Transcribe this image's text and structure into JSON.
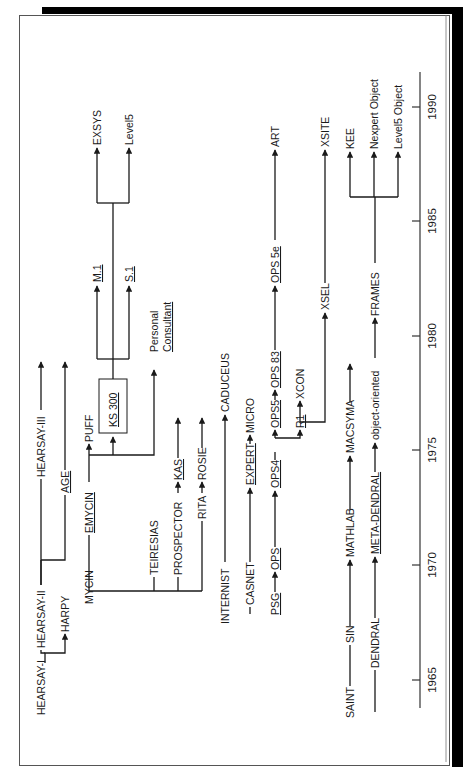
{
  "figure": {
    "orientation": "rotated -90deg (text reads bottom-to-top)"
  },
  "timeline": {
    "ticks": [
      {
        "label": "1965",
        "y": 680
      },
      {
        "label": "1970",
        "y": 565
      },
      {
        "label": "1975",
        "y": 450
      },
      {
        "label": "1980",
        "y": 336
      },
      {
        "label": "1985",
        "y": 221
      },
      {
        "label": "1990",
        "y": 107
      }
    ]
  },
  "nodes": {
    "hearsay1": "HEARSAY-I",
    "hearsay2": "HEARSAY-II",
    "hearsay3": "HEARSAY-III",
    "harpy": "HARPY",
    "age": "AGE",
    "mycin": "MYCIN",
    "emycin": "EMYCIN",
    "puff": "PUFF",
    "ks300": "KS 300",
    "m1": "M.1",
    "s1": "S.1",
    "exsys": "EXSYS",
    "level5": "Level5",
    "personal": "Personal",
    "consultant": "Consultant",
    "teiresias": "TEIRESIAS",
    "prospector": "PROSPECTOR",
    "kas": "KAS",
    "rita": "RITA",
    "rosie": "ROSIE",
    "internist": "INTERNIST",
    "caduceus": "CADUCEUS",
    "casnet": "CASNET",
    "expert": "EXPERT",
    "micro": "MICRO",
    "psg": "PSG",
    "ops": "OPS",
    "ops4": "OPS4",
    "ops5": "OPS5",
    "ops83": "OPS 83",
    "ops5e": "OPS 5e",
    "art": "ART",
    "r1": "R1",
    "xcon": "XCON",
    "xsel": "XSEL",
    "xsite": "XSITE",
    "saint": "SAINT",
    "sin": "SIN",
    "mathlab": "MATHLAB",
    "macsyma": "MACSYMA",
    "dendral": "DENDRAL",
    "metadendral": "META-DENDRAL",
    "objectoriented": "object-oriented",
    "frames": "FRAMES",
    "kee": "KEE",
    "nexpert": "Nexpert Object",
    "level5object": "Level5 Object"
  },
  "colors": {
    "ink": "#1a1a1a",
    "frame": "#555555",
    "shadow": "#000000",
    "background": "#ffffff"
  }
}
